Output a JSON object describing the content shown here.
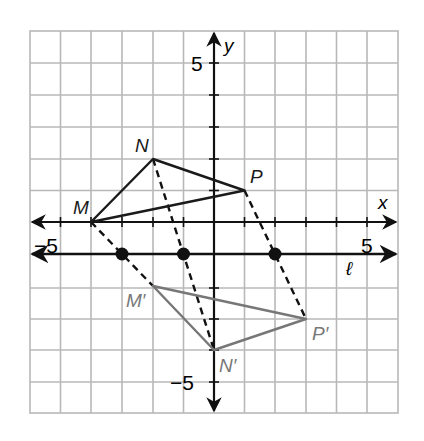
{
  "diagram": {
    "type": "coordinate-plane-reflection",
    "axes": {
      "x_label": "x",
      "y_label": "y",
      "x_tick_labels": [
        {
          "value": -5,
          "text": "−5"
        },
        {
          "value": 5,
          "text": "5"
        }
      ],
      "y_tick_labels": [
        {
          "value": 5,
          "text": "5"
        },
        {
          "value": -5,
          "text": "−5"
        }
      ],
      "x_range": [
        -6,
        6
      ],
      "y_range": [
        -6,
        6
      ]
    },
    "reflection_line": {
      "label": "ℓ",
      "equation": "y = -1"
    },
    "original_triangle": {
      "color": "#1a1a1a",
      "vertices": [
        {
          "label": "M",
          "x": -4,
          "y": 0
        },
        {
          "label": "N",
          "x": -2,
          "y": 2
        },
        {
          "label": "P",
          "x": 1,
          "y": 1
        }
      ]
    },
    "image_triangle": {
      "color": "#777777",
      "vertices": [
        {
          "label": "M′",
          "x": -2,
          "y": -2
        },
        {
          "label": "N′",
          "x": 0,
          "y": -4
        },
        {
          "label": "P′",
          "x": 3,
          "y": -3
        }
      ]
    },
    "midpoints_on_line": [
      {
        "x": -3,
        "y": -1
      },
      {
        "x": -1,
        "y": -1
      },
      {
        "x": 2,
        "y": -1
      }
    ],
    "colors": {
      "grid": "#b5b5b5",
      "axes": "#111111",
      "original": "#1a1a1a",
      "image": "#777777"
    }
  }
}
